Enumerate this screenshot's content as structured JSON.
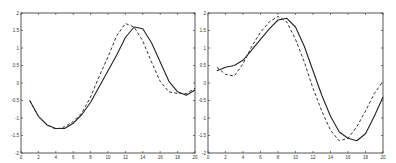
{
  "chart_data": [
    {
      "type": "line",
      "title": "",
      "xlabel": "",
      "ylabel": "",
      "xlim": [
        0,
        20
      ],
      "ylim": [
        -2,
        2
      ],
      "grid": false,
      "legend": null,
      "x_ticks": [
        "0",
        "2",
        "4",
        "6",
        "8",
        "10",
        "12",
        "14",
        "16",
        "18",
        "20"
      ],
      "y_ticks": [
        "-2",
        "-1.5",
        "-1",
        "-0.5",
        "0",
        "0.5",
        "1",
        "1.5",
        "2"
      ],
      "x": [
        1,
        2,
        3,
        4,
        5,
        6,
        7,
        8,
        9,
        10,
        11,
        12,
        13,
        14,
        15,
        16,
        17,
        18,
        19,
        20
      ],
      "series": [
        {
          "name": "solid",
          "style": "solid",
          "values": [
            -0.5,
            -0.95,
            -1.2,
            -1.3,
            -1.3,
            -1.15,
            -0.9,
            -0.55,
            -0.1,
            0.35,
            0.8,
            1.3,
            1.6,
            1.55,
            1.15,
            0.6,
            0.05,
            -0.25,
            -0.35,
            -0.2
          ]
        },
        {
          "name": "dashed",
          "style": "dashed",
          "values": [
            -0.5,
            -0.95,
            -1.2,
            -1.32,
            -1.25,
            -1.1,
            -0.85,
            -0.4,
            0.2,
            0.75,
            1.35,
            1.7,
            1.6,
            1.2,
            0.6,
            0.05,
            -0.25,
            -0.3,
            -0.3,
            -0.15
          ]
        }
      ]
    },
    {
      "type": "line",
      "title": "",
      "xlabel": "",
      "ylabel": "",
      "xlim": [
        0,
        20
      ],
      "ylim": [
        -2,
        2
      ],
      "grid": false,
      "legend": null,
      "x_ticks": [
        "0",
        "2",
        "4",
        "6",
        "8",
        "10",
        "12",
        "14",
        "16",
        "18",
        "20"
      ],
      "y_ticks": [
        "-2",
        "-1.5",
        "-1",
        "-0.5",
        "0",
        "0.5",
        "1",
        "1.5",
        "2"
      ],
      "x": [
        1,
        2,
        3,
        4,
        5,
        6,
        7,
        8,
        9,
        10,
        11,
        12,
        13,
        14,
        15,
        16,
        17,
        18,
        19,
        20
      ],
      "series": [
        {
          "name": "solid",
          "style": "solid",
          "values": [
            0.35,
            0.45,
            0.5,
            0.65,
            0.95,
            1.25,
            1.55,
            1.8,
            1.85,
            1.6,
            1.05,
            0.35,
            -0.35,
            -0.95,
            -1.4,
            -1.58,
            -1.65,
            -1.45,
            -0.95,
            -0.4
          ]
        },
        {
          "name": "dashed",
          "style": "dashed",
          "values": [
            0.45,
            0.25,
            0.2,
            0.55,
            1.05,
            1.45,
            1.75,
            1.9,
            1.75,
            1.25,
            0.6,
            -0.15,
            -0.8,
            -1.35,
            -1.65,
            -1.58,
            -1.25,
            -0.8,
            -0.3,
            0.05
          ]
        }
      ]
    }
  ],
  "layout": {
    "plots": [
      {
        "left": 21,
        "top": 13,
        "right": 195,
        "bottom": 153
      },
      {
        "left": 208,
        "top": 13,
        "right": 383,
        "bottom": 153
      }
    ]
  }
}
